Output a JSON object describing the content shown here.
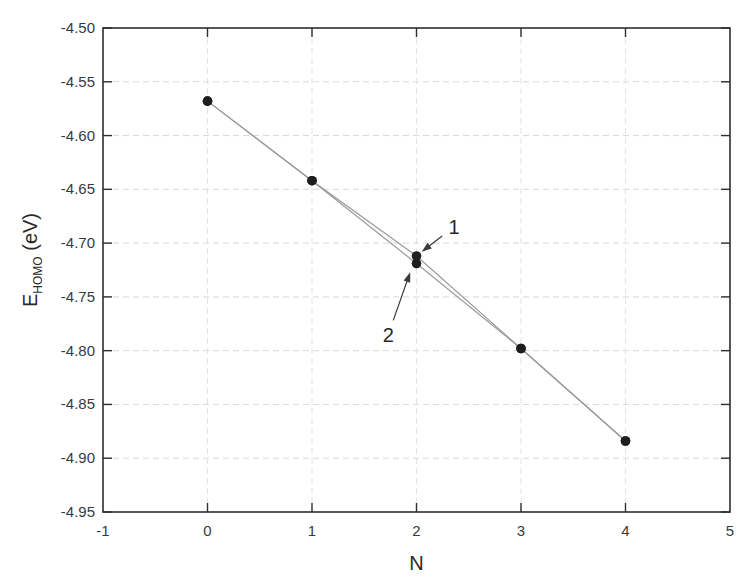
{
  "chart_data": {
    "type": "line",
    "title": "",
    "xlabel": "N",
    "ylabel_main": "E",
    "ylabel_sub": "HOMO",
    "ylabel_unit": " (eV)",
    "xlim": [
      -1,
      5
    ],
    "ylim": [
      -4.95,
      -4.5
    ],
    "xticks": [
      -1,
      0,
      1,
      2,
      3,
      4,
      5
    ],
    "xtick_labels": [
      "-1",
      "0",
      "1",
      "2",
      "3",
      "4",
      "5"
    ],
    "yticks": [
      -4.95,
      -4.9,
      -4.85,
      -4.8,
      -4.75,
      -4.7,
      -4.65,
      -4.6,
      -4.55,
      -4.5
    ],
    "ytick_labels": [
      "-4.95",
      "-4.90",
      "-4.85",
      "-4.80",
      "-4.75",
      "-4.70",
      "-4.65",
      "-4.60",
      "-4.55",
      "-4.50"
    ],
    "grid": true,
    "legend": null,
    "series": [
      {
        "name": "1",
        "x": [
          0,
          1,
          2,
          3,
          4
        ],
        "y": [
          -4.568,
          -4.642,
          -4.712,
          -4.798,
          -4.884
        ]
      },
      {
        "name": "2",
        "x": [
          0,
          1,
          2,
          3,
          4
        ],
        "y": [
          -4.568,
          -4.642,
          -4.719,
          -4.798,
          -4.884
        ]
      }
    ],
    "annotations": [
      {
        "text": "1",
        "label_x": 2.36,
        "label_y": -4.685,
        "arrow_to_x": 2.05,
        "arrow_to_y": -4.708
      },
      {
        "text": "2",
        "label_x": 1.73,
        "label_y": -4.785,
        "arrow_to_x": 1.94,
        "arrow_to_y": -4.727
      }
    ]
  }
}
